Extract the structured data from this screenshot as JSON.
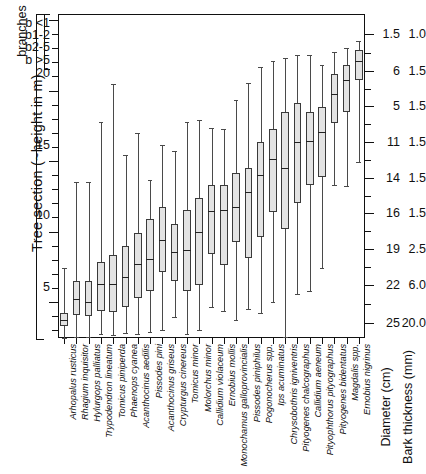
{
  "axes": {
    "y_title": "Tree section (~height in m)",
    "branches_title": "branches",
    "branch_labels": [
      "b <1",
      "b1-2",
      "b2-5",
      "b >5"
    ],
    "y_ticks": [
      "20",
      "15",
      "10",
      "5"
    ],
    "right_title_diameter": "Diameter (cm)",
    "right_title_bark": "Bark thickness (mm)",
    "diameter_values": [
      "1.5",
      "6",
      "5",
      "11",
      "14",
      "16",
      "19",
      "22",
      "25"
    ],
    "bark_values": [
      "1.0",
      "1.5",
      "1.5",
      "1.5",
      "1.5",
      "1.5",
      "2.5",
      "6.0",
      "20.0"
    ]
  },
  "chart_data": {
    "type": "box",
    "title": "",
    "xlabel": "",
    "ylabel": "Tree section (~height in m)",
    "ylim": [
      0,
      25
    ],
    "y_inverted": true,
    "grid": false,
    "legend": "none",
    "note": "Vertical boxplots of tree-section (height) distribution per bark-beetle / longhorn species; y axis reads downward from branch categories at top to 25 m section at the stem base.",
    "categories": [
      "Arhopalus rusticus",
      "Rhagium inquisitor",
      "Hylurgops palliatus",
      "Trypodendron lineatum",
      "Tomicus piniperda",
      "Phaenops cyanea",
      "Acanthocinus aedilis",
      "Pissodes pini",
      "Acanthocinus griseus",
      "Crypturgus cinereus",
      "Tomicus minor",
      "Molorchus minor",
      "Callidium violaceum",
      "Ernobius mollis",
      "Monochamus galloprovincialis",
      "Pissodes piniphilus",
      "Pogonocherus spp.",
      "Ips acuminatus",
      "Chrysobothris igniventris",
      "Pityogenes chalcographus",
      "Callidium aeneum",
      "Pityophthorus pityographus",
      "Pityogenes bidentatus",
      "Magdalis spp.",
      "Ernobius nigrinus"
    ],
    "boxes": [
      {
        "min": 25.0,
        "q1": 24.1,
        "med": 23.6,
        "q3": 23.1,
        "max": 19.6
      },
      {
        "min": 24.9,
        "q1": 23.2,
        "med": 22.0,
        "q3": 20.6,
        "max": 13.0
      },
      {
        "min": 24.9,
        "q1": 23.3,
        "med": 22.2,
        "q3": 20.6,
        "max": 13.0
      },
      {
        "min": 24.7,
        "q1": 22.9,
        "med": 20.8,
        "q3": 19.1,
        "max": 8.3
      },
      {
        "min": 24.8,
        "q1": 23.0,
        "med": 20.8,
        "q3": 18.6,
        "max": 5.4
      },
      {
        "min": 24.6,
        "q1": 22.6,
        "med": 20.3,
        "q3": 17.9,
        "max": 10.9
      },
      {
        "min": 24.7,
        "q1": 21.9,
        "med": 19.3,
        "q3": 16.9,
        "max": 9.2
      },
      {
        "min": 24.5,
        "q1": 21.4,
        "med": 18.9,
        "q3": 15.8,
        "max": 12.8
      },
      {
        "min": 24.4,
        "q1": 19.9,
        "med": 17.4,
        "q3": 14.9,
        "max": 10.1
      },
      {
        "min": 23.4,
        "q1": 20.6,
        "med": 18.4,
        "q3": 16.2,
        "max": 10.6
      },
      {
        "min": 24.7,
        "q1": 21.4,
        "med": 18.2,
        "q3": 15.1,
        "max": 8.3
      },
      {
        "min": 24.4,
        "q1": 20.9,
        "med": 16.8,
        "q3": 14.2,
        "max": 8.2
      },
      {
        "min": 22.6,
        "q1": 18.5,
        "med": 15.2,
        "q3": 13.2,
        "max": 8.8
      },
      {
        "min": 22.9,
        "q1": 19.4,
        "med": 15.1,
        "q3": 13.2,
        "max": 8.9
      },
      {
        "min": 23.6,
        "q1": 17.6,
        "med": 14.9,
        "q3": 12.3,
        "max": 6.6
      },
      {
        "min": 22.8,
        "q1": 18.8,
        "med": 13.7,
        "q3": 11.9,
        "max": 5.3
      },
      {
        "min": 23.1,
        "q1": 17.2,
        "med": 12.4,
        "q3": 9.9,
        "max": 4.1
      },
      {
        "min": 22.2,
        "q1": 15.3,
        "med": 11.2,
        "q3": 8.9,
        "max": 3.6
      },
      {
        "min": 24.9,
        "q1": 16.6,
        "med": 11.9,
        "q3": 7.6,
        "max": 3.4
      },
      {
        "min": 21.6,
        "q1": 14.6,
        "med": 9.9,
        "q3": 6.9,
        "max": 3.2
      },
      {
        "min": 21.4,
        "q1": 13.2,
        "med": 9.8,
        "q3": 7.6,
        "max": 3.2
      },
      {
        "min": 19.6,
        "q1": 12.6,
        "med": 9.1,
        "q3": 7.2,
        "max": 3.9
      },
      {
        "min": 13.2,
        "q1": 8.4,
        "med": 6.2,
        "q3": 4.6,
        "max": 2.9
      },
      {
        "min": 13.3,
        "q1": 7.6,
        "med": 5.1,
        "q3": 3.9,
        "max": 2.6
      },
      {
        "min": 11.4,
        "q1": 5.1,
        "med": 3.6,
        "q3": 2.8,
        "max": 2.1
      }
    ]
  }
}
